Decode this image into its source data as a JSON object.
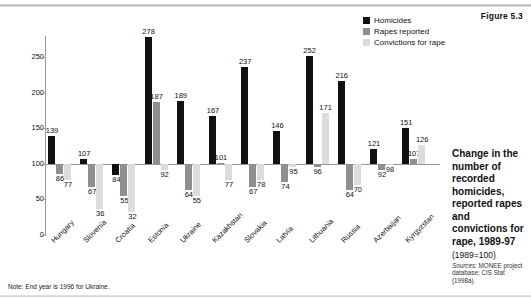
{
  "figure_number": "Figure 5.3",
  "legend": [
    {
      "key": "homicides",
      "label": "Homicides",
      "color": "#111111"
    },
    {
      "key": "rapes",
      "label": "Rapes reported",
      "color": "#8f8f8f"
    },
    {
      "key": "convictions",
      "label": "Convictions for rape",
      "color": "#dcdcdc"
    }
  ],
  "note": "Note: End year is 1996 for Ukraine.",
  "caption": {
    "title": "Change in the number of recorded homicides, reported rapes and convictions for rape, 1989-97",
    "subtitle": "(1989=100)",
    "sources_label": "Sources:",
    "sources_text": "MONEE project database; CIS Stat (1998a)."
  },
  "chart_data": {
    "type": "bar",
    "title": "Change in the number of recorded homicides, reported rapes and convictions for rape, 1989-97",
    "subtitle": "(1989=100)",
    "xlabel": "",
    "ylabel": "",
    "ylim": [
      0,
      280
    ],
    "yticks": [
      0,
      50,
      100,
      150,
      200,
      250
    ],
    "baseline": 100,
    "grid": false,
    "legend_position": "top-right",
    "categories": [
      "Hungary",
      "Slovenia",
      "Croatia",
      "Estonia",
      "Ukraine",
      "Kazakhstan",
      "Slovakia",
      "Latvia",
      "Lithuania",
      "Russia",
      "Azerbaijan",
      "Kyrgyzstan"
    ],
    "series": [
      {
        "name": "Homicides",
        "color": "#111111",
        "values": [
          139,
          107,
          84,
          278,
          189,
          167,
          237,
          146,
          252,
          216,
          121,
          151
        ]
      },
      {
        "name": "Rapes reported",
        "color": "#8f8f8f",
        "values": [
          86,
          67,
          55,
          187,
          64,
          101,
          67,
          74,
          96,
          64,
          92,
          107
        ]
      },
      {
        "name": "Convictions for rape",
        "color": "#dcdcdc",
        "values": [
          77,
          36,
          32,
          92,
          55,
          77,
          78,
          95,
          171,
          70,
          98,
          126
        ]
      }
    ]
  }
}
